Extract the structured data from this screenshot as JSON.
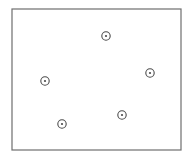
{
  "diagram": {
    "frame": {
      "x": 12,
      "y": 9,
      "width": 169,
      "height": 141,
      "stroke": "#6e6e6e"
    },
    "marker_style": {
      "outer_radius": 4.2,
      "inner_radius": 1.1,
      "stroke": "#4a4a4a",
      "fill": "#4a4a4a"
    },
    "points": [
      {
        "id": "p1",
        "cx": 106,
        "cy": 36
      },
      {
        "id": "p2",
        "cx": 150,
        "cy": 73
      },
      {
        "id": "p3",
        "cx": 45,
        "cy": 81
      },
      {
        "id": "p4",
        "cx": 122,
        "cy": 115
      },
      {
        "id": "p5",
        "cx": 62,
        "cy": 124
      }
    ]
  }
}
